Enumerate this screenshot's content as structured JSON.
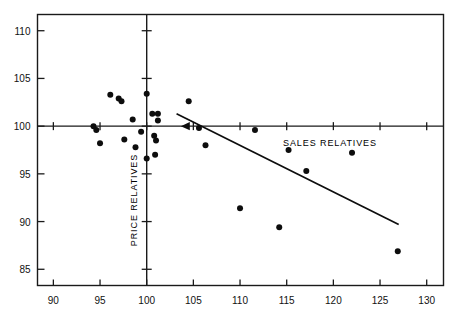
{
  "chart_data": {
    "type": "scatter",
    "title": "",
    "subtitle": "",
    "xlabel": "SALES RELATIVES",
    "ylabel": "PRICE RELATIVES",
    "xlim": [
      88.3,
      131.8
    ],
    "ylim": [
      83.3,
      111.7
    ],
    "xticks": [
      90,
      95,
      100,
      105,
      110,
      115,
      120,
      125,
      130
    ],
    "yticks": [
      85,
      90,
      95,
      100,
      105,
      110
    ],
    "xtick_labels": [
      "90",
      "95",
      "100",
      "105",
      "110",
      "115",
      "120",
      "125",
      "130"
    ],
    "ytick_labels": [
      "85",
      "90",
      "95",
      "100",
      "105",
      "110"
    ],
    "grid": false,
    "legend": null,
    "reference_lines": [
      {
        "name": "x-reference",
        "orientation": "vertical",
        "value": 100
      },
      {
        "name": "y-reference",
        "orientation": "horizontal",
        "value": 100
      }
    ],
    "annotations": [
      {
        "name": "axis-arrow-marker",
        "x": 104.3,
        "y": 100,
        "symbol": "left-arrowhead"
      }
    ],
    "series": [
      {
        "name": "observations",
        "marker": "filled-circle",
        "color": "#0d0d0d",
        "points": [
          {
            "x": 94.3,
            "y": 100.0
          },
          {
            "x": 94.6,
            "y": 99.6
          },
          {
            "x": 95.0,
            "y": 98.2
          },
          {
            "x": 96.1,
            "y": 103.3
          },
          {
            "x": 97.0,
            "y": 102.9
          },
          {
            "x": 97.3,
            "y": 102.6
          },
          {
            "x": 97.6,
            "y": 98.6
          },
          {
            "x": 98.5,
            "y": 100.7
          },
          {
            "x": 98.8,
            "y": 97.8
          },
          {
            "x": 99.4,
            "y": 99.4
          },
          {
            "x": 100.0,
            "y": 103.4
          },
          {
            "x": 100.0,
            "y": 96.6
          },
          {
            "x": 100.6,
            "y": 101.3
          },
          {
            "x": 101.2,
            "y": 101.3
          },
          {
            "x": 101.2,
            "y": 100.6
          },
          {
            "x": 100.8,
            "y": 99.0
          },
          {
            "x": 100.9,
            "y": 97.0
          },
          {
            "x": 101.0,
            "y": 98.5
          },
          {
            "x": 104.5,
            "y": 102.6
          },
          {
            "x": 105.6,
            "y": 99.8
          },
          {
            "x": 106.3,
            "y": 98.0
          },
          {
            "x": 110.0,
            "y": 91.4
          },
          {
            "x": 111.6,
            "y": 99.6
          },
          {
            "x": 114.2,
            "y": 89.4
          },
          {
            "x": 115.2,
            "y": 97.5
          },
          {
            "x": 117.1,
            "y": 95.3
          },
          {
            "x": 122.0,
            "y": 97.2
          },
          {
            "x": 126.9,
            "y": 86.9
          }
        ]
      }
    ],
    "trendline": {
      "name": "regression-line",
      "x_start": 103.2,
      "y_start": 101.3,
      "x_end": 127.0,
      "y_end": 89.7
    }
  },
  "figure": {
    "background_color": "#ffffff",
    "ink_color": "#0d0d0d",
    "frame_color": "#1a1a1a"
  }
}
